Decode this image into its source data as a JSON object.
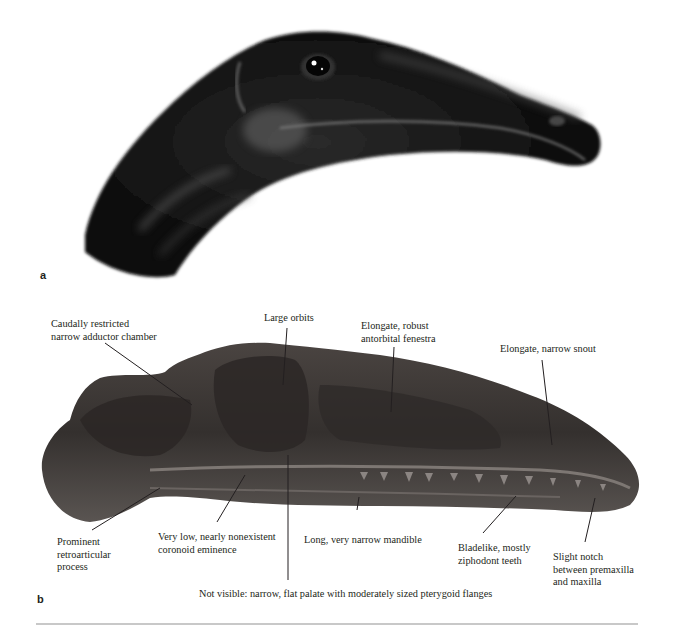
{
  "figure": {
    "panels": [
      {
        "label": "a",
        "content": "Life reconstruction of head (illustration)"
      },
      {
        "label": "b",
        "content": "Fossil skull, lateral view (photograph)"
      }
    ]
  },
  "annotations": {
    "adductor": "Caudally restricted\nnarrow adductor chamber",
    "orbits": "Large orbits",
    "fenestra": "Elongate, robust\nantorbital fenestra",
    "snout": "Elongate, narrow snout",
    "retroarticular": "Prominent\nretroarticular\nprocess",
    "coronoid": "Very low, nearly nonexistent\ncoronoid eminence",
    "mandible": "Long, very narrow mandible",
    "teeth": "Bladelike, mostly\nziphodont teeth",
    "notch": "Slight notch\nbetween premaxilla\nand maxilla",
    "palate": "Not visible: narrow, flat palate with moderately sized pterygoid flanges"
  },
  "colors": {
    "text": "#231f20",
    "divider": "#c8c8c8",
    "head_dark": "#0d0d0d",
    "skull_dark": "#3a3533"
  }
}
